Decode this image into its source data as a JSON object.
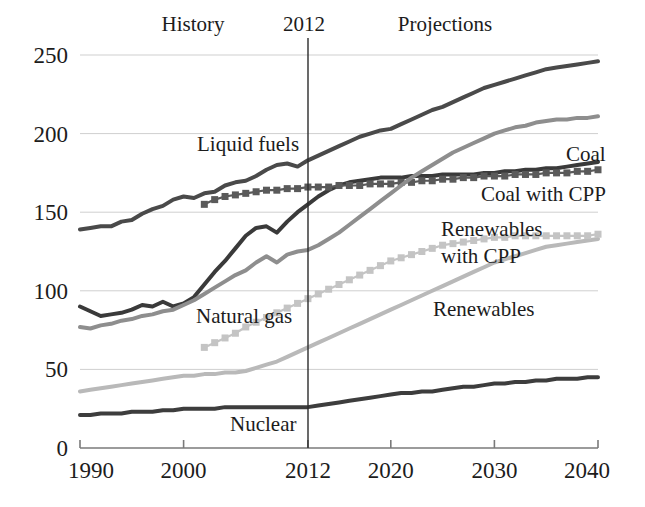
{
  "figure": {
    "title": "",
    "annotations": [
      {
        "name": "history-label",
        "text": "History",
        "x": 193,
        "y": 31
      },
      {
        "name": "year-divider-label",
        "text": "2012",
        "x": 304,
        "y": 31
      },
      {
        "name": "projections-label",
        "text": "Projections",
        "x": 445,
        "y": 31
      }
    ]
  },
  "axes": {
    "x": {
      "label": "",
      "ticks": [
        "1990",
        "2000",
        "2012",
        "2020",
        "2030",
        "2040"
      ],
      "tick_values": [
        1990,
        2000,
        2012,
        2020,
        2030,
        2040
      ],
      "range": [
        1990,
        2040
      ],
      "pixel_range": [
        80,
        598
      ]
    },
    "y": {
      "label": "",
      "ticks": [
        "0",
        "50",
        "100",
        "150",
        "200",
        "250"
      ],
      "tick_values": [
        0,
        50,
        100,
        150,
        200,
        250
      ],
      "range": [
        0,
        250
      ],
      "pixel_range": [
        448,
        55
      ],
      "grid": true
    },
    "divider": {
      "value": 2012,
      "pixel_x": 308
    }
  },
  "colors": {
    "liquid_fuels": "#4a4a4a",
    "coal": "#3a3a3a",
    "coal_with_cpp": "#5a5a5a",
    "natural_gas": "#8e8e8e",
    "renewables": "#b9b9b9",
    "renewables_with_cpp": "#c4c4c4",
    "nuclear": "#3d3d3d",
    "grid": "#cfcfcf",
    "axis": "#7a7a7a",
    "divider": "#2b2b2b",
    "text": "#1c1c1c",
    "background": "#ffffff"
  },
  "series_labels": [
    {
      "name": "liquid-fuels-label",
      "text": "Liquid fuels",
      "x": 197,
      "y": 151
    },
    {
      "name": "coal-label",
      "text": "Coal",
      "x": 566,
      "y": 161
    },
    {
      "name": "coal-with-cpp-label",
      "text": "Coal with CPP",
      "x": 481,
      "y": 201
    },
    {
      "name": "renewables-with-cpp-label-line1",
      "text": "Renewables",
      "x": 441,
      "y": 236
    },
    {
      "name": "renewables-with-cpp-label-line2",
      "text": "with CPP",
      "x": 441,
      "y": 263
    },
    {
      "name": "renewables-label",
      "text": "Renewables",
      "x": 433,
      "y": 316
    },
    {
      "name": "natural-gas-label",
      "text": "Natural gas",
      "x": 196,
      "y": 323
    },
    {
      "name": "nuclear-label",
      "text": "Nuclear",
      "x": 230,
      "y": 431
    }
  ],
  "chart_data": {
    "type": "line",
    "title": "",
    "xlabel": "",
    "ylabel": "",
    "xlim": [
      1990,
      2040
    ],
    "ylim": [
      0,
      250
    ],
    "grid": true,
    "legend": "inline-annotations",
    "annotations": [
      "History",
      "2012",
      "Projections"
    ],
    "divider_year": 2012,
    "x": [
      1990,
      1991,
      1992,
      1993,
      1994,
      1995,
      1996,
      1997,
      1998,
      1999,
      2000,
      2001,
      2002,
      2003,
      2004,
      2005,
      2006,
      2007,
      2008,
      2009,
      2010,
      2011,
      2012,
      2013,
      2014,
      2015,
      2016,
      2017,
      2018,
      2019,
      2020,
      2021,
      2022,
      2023,
      2024,
      2025,
      2026,
      2027,
      2028,
      2029,
      2030,
      2031,
      2032,
      2033,
      2034,
      2035,
      2036,
      2037,
      2038,
      2039,
      2040
    ],
    "series": [
      {
        "name": "Liquid fuels",
        "style": "solid",
        "color": "#4a4a4a",
        "width": 4,
        "values": [
          139,
          140,
          141,
          141,
          144,
          145,
          149,
          152,
          154,
          158,
          160,
          159,
          162,
          163,
          167,
          169,
          170,
          173,
          177,
          180,
          181,
          179,
          183,
          186,
          189,
          192,
          195,
          198,
          200,
          202,
          203,
          206,
          209,
          212,
          215,
          217,
          220,
          223,
          226,
          229,
          231,
          233,
          235,
          237,
          239,
          241,
          242,
          243,
          244,
          245,
          246
        ]
      },
      {
        "name": "Coal",
        "style": "solid",
        "color": "#3a3a3a",
        "width": 4,
        "values": [
          90,
          87,
          84,
          85,
          86,
          88,
          91,
          90,
          93,
          90,
          92,
          96,
          104,
          112,
          119,
          127,
          135,
          140,
          141,
          137,
          144,
          150,
          155,
          160,
          164,
          167,
          169,
          170,
          171,
          172,
          172,
          172,
          173,
          173,
          173,
          174,
          174,
          174,
          174,
          175,
          175,
          176,
          176,
          177,
          177,
          178,
          178,
          179,
          180,
          181,
          182
        ]
      },
      {
        "name": "Coal with CPP",
        "style": "markers",
        "color": "#5a5a5a",
        "width": 4,
        "values": [
          null,
          null,
          null,
          null,
          null,
          null,
          null,
          null,
          null,
          null,
          null,
          null,
          155,
          158,
          160,
          161,
          162,
          163,
          164,
          164,
          165,
          165,
          166,
          166,
          166,
          167,
          167,
          167,
          168,
          168,
          168,
          169,
          169,
          170,
          170,
          171,
          171,
          172,
          172,
          173,
          173,
          173,
          174,
          174,
          174,
          175,
          175,
          175,
          176,
          176,
          177
        ]
      },
      {
        "name": "Natural gas",
        "style": "solid",
        "color": "#8e8e8e",
        "width": 4,
        "values": [
          77,
          76,
          78,
          79,
          81,
          82,
          84,
          85,
          87,
          88,
          91,
          94,
          98,
          102,
          106,
          110,
          113,
          118,
          122,
          118,
          123,
          125,
          126,
          129,
          133,
          137,
          142,
          147,
          152,
          157,
          162,
          167,
          172,
          176,
          180,
          184,
          188,
          191,
          194,
          197,
          200,
          202,
          204,
          205,
          207,
          208,
          209,
          209,
          210,
          210,
          211
        ]
      },
      {
        "name": "Renewables",
        "style": "solid",
        "color": "#b9b9b9",
        "width": 4,
        "values": [
          36,
          37,
          38,
          39,
          40,
          41,
          42,
          43,
          44,
          45,
          46,
          46,
          47,
          47,
          48,
          48,
          49,
          51,
          53,
          55,
          58,
          61,
          64,
          67,
          70,
          73,
          76,
          79,
          82,
          85,
          88,
          91,
          94,
          97,
          100,
          103,
          106,
          109,
          112,
          115,
          118,
          120,
          122,
          124,
          126,
          128,
          129,
          130,
          131,
          132,
          133
        ]
      },
      {
        "name": "Renewables with CPP",
        "style": "markers",
        "color": "#c4c4c4",
        "width": 4,
        "values": [
          null,
          null,
          null,
          null,
          null,
          null,
          null,
          null,
          null,
          null,
          null,
          null,
          64,
          67,
          70,
          73,
          77,
          80,
          83,
          86,
          89,
          92,
          95,
          98,
          101,
          104,
          107,
          110,
          113,
          116,
          119,
          121,
          123,
          125,
          127,
          129,
          130,
          131,
          132,
          133,
          134,
          134,
          135,
          135,
          135,
          135,
          135,
          135,
          135,
          135,
          136
        ]
      },
      {
        "name": "Nuclear",
        "style": "solid",
        "color": "#3d3d3d",
        "width": 4,
        "values": [
          21,
          21,
          22,
          22,
          22,
          23,
          23,
          23,
          24,
          24,
          25,
          25,
          25,
          25,
          26,
          26,
          26,
          26,
          26,
          26,
          26,
          26,
          26,
          27,
          28,
          29,
          30,
          31,
          32,
          33,
          34,
          35,
          35,
          36,
          36,
          37,
          38,
          39,
          39,
          40,
          41,
          41,
          42,
          42,
          43,
          43,
          44,
          44,
          44,
          45,
          45
        ]
      }
    ]
  }
}
